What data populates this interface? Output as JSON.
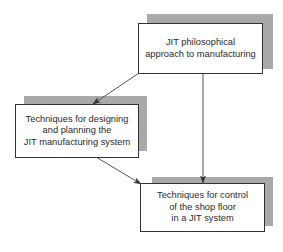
{
  "diagram": {
    "type": "flowchart",
    "nodes": [
      {
        "id": "jit-philosophy",
        "label": "JIT philosophical\napproach to manufacturing"
      },
      {
        "id": "design-planning",
        "label": "Techniques for designing\nand planning the\nJIT manufacturing system"
      },
      {
        "id": "shop-floor-control",
        "label": "Techniques for control\nof the shop floor\nin a JIT system"
      }
    ],
    "edges": [
      {
        "from": "jit-philosophy",
        "to": "design-planning"
      },
      {
        "from": "jit-philosophy",
        "to": "shop-floor-control"
      },
      {
        "from": "design-planning",
        "to": "shop-floor-control"
      }
    ]
  },
  "colors": {
    "box_border": "#333333",
    "shadow": "#a9a9a9",
    "arrow": "#555555",
    "text": "#2a2a2a"
  }
}
